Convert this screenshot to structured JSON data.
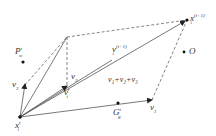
{
  "diagram": {
    "type": "vector-update-diagram",
    "colors": {
      "line": "#555555",
      "dashed": "#666666",
      "point": "#111111",
      "text": "#333333"
    },
    "points": {
      "x_it": {
        "base": "x",
        "sub": "i",
        "sup": "t",
        "pos": [
          20,
          117
        ]
      },
      "x_it1": {
        "base": "x",
        "sub": "i",
        "sup": "(t+1)",
        "pos": [
          187,
          20
        ]
      },
      "p_wt": {
        "base": "P",
        "sub": "w",
        "sup": "t",
        "pos": [
          23,
          62
        ]
      },
      "g_gt": {
        "base": "G",
        "sub": "g",
        "sup": "t",
        "pos": [
          118,
          103
        ]
      },
      "o": {
        "base": "O",
        "pos": [
          184,
          52
        ]
      }
    },
    "vectors": {
      "v1": {
        "base": "v",
        "sub": "1"
      },
      "v2": {
        "base": "v",
        "sub": "2"
      },
      "v3": {
        "base": "v",
        "sub": "3"
      },
      "v_it": {
        "base": "v",
        "sub": "i",
        "sup": "t"
      },
      "v_it1": {
        "base": "v",
        "sub": "i",
        "sup": "(t+1)"
      },
      "sum": {
        "label": "v₁+v₂+v₃"
      }
    }
  }
}
